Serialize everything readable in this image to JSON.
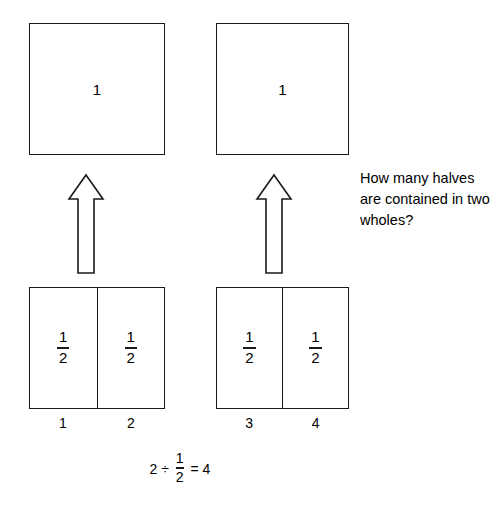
{
  "diagram": {
    "title_text": "",
    "wholes": [
      {
        "label": "1"
      },
      {
        "label": "1"
      }
    ],
    "halves_groups": [
      {
        "cells": [
          {
            "numerator": "1",
            "denominator": "2",
            "count": "1"
          },
          {
            "numerator": "1",
            "denominator": "2",
            "count": "2"
          }
        ]
      },
      {
        "cells": [
          {
            "numerator": "1",
            "denominator": "2",
            "count": "3"
          },
          {
            "numerator": "1",
            "denominator": "2",
            "count": "4"
          }
        ]
      }
    ],
    "arrows": [
      {
        "name": "up-arrow-left"
      },
      {
        "name": "up-arrow-right"
      }
    ],
    "question": "How many halves are contained in two wholes?",
    "equation": {
      "dividend": "2",
      "divide_sign": "÷",
      "divisor_numerator": "1",
      "divisor_denominator": "2",
      "equals_sign": "=",
      "result": "4"
    },
    "colors": {
      "stroke": "#1a1a1a",
      "background": "#ffffff",
      "text": "#000000"
    }
  }
}
